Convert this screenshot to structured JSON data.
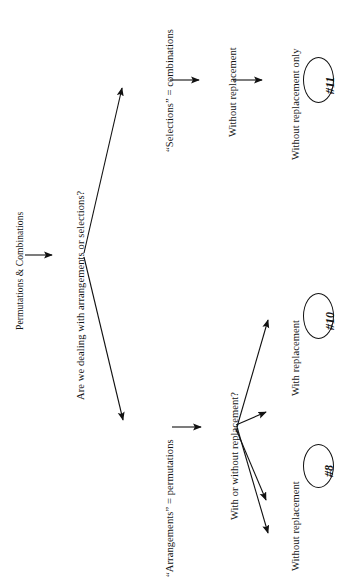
{
  "diagram": {
    "title": "Permutations & Combinations",
    "orientation": "rotated-90-ccw",
    "background_color": "#ffffff",
    "line_color": "#111111",
    "nodes": {
      "root_title": "Permutations & Combinations",
      "decision_1": "Are we dealing with arrangements or selections?",
      "branch_selections": "“Selections” = combinations",
      "branch_arrangements": "“Arrangements” = permutations",
      "selections_without_replacement": "Without replacement",
      "selections_without_replacement_only": "Without replacement only",
      "decision_2": "With or without replacement?",
      "arrangements_with_replacement": "With replacement",
      "arrangements_without_replacement": "Without replacement"
    },
    "outcomes": {
      "combinations_result": "#11",
      "permutations_with_replacement_result": "#10",
      "permutations_without_replacement_result": "#8"
    }
  }
}
